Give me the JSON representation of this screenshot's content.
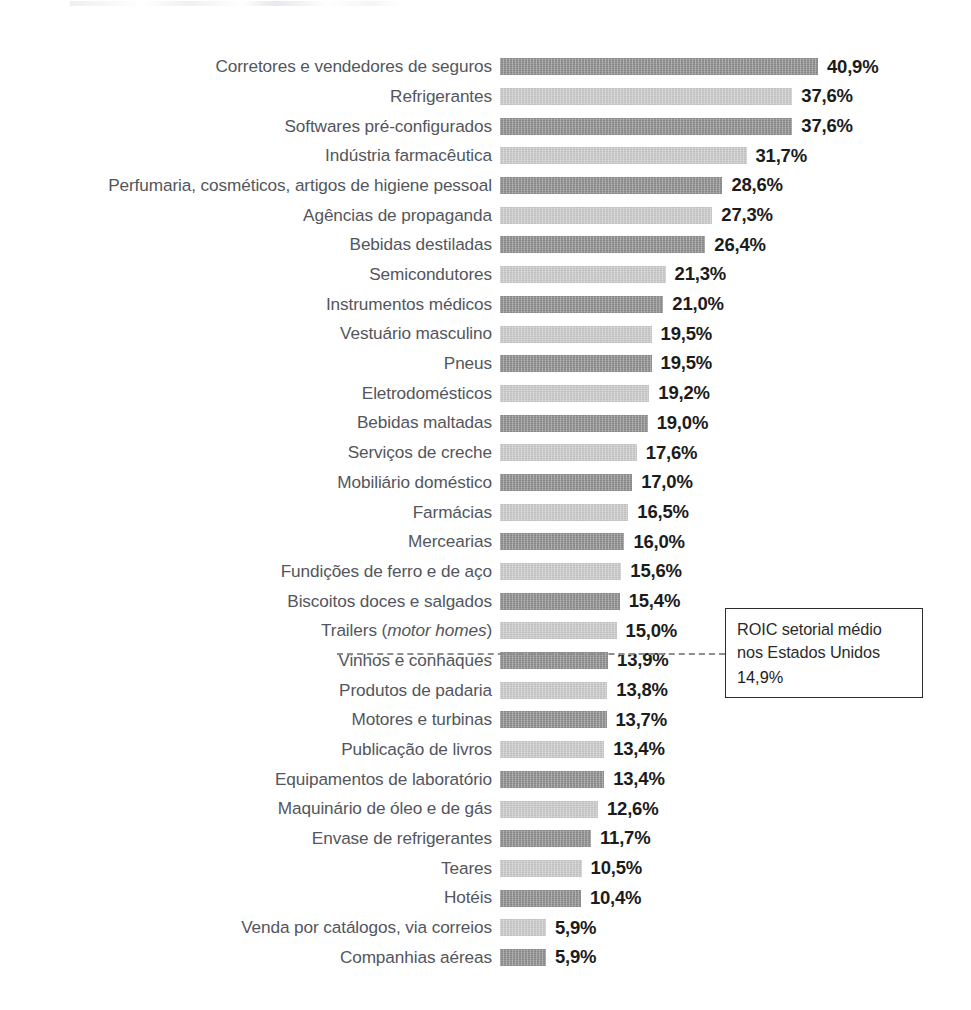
{
  "chart_data": {
    "type": "bar",
    "orientation": "horizontal",
    "title": "",
    "xlabel": "",
    "ylabel": "",
    "value_suffix": "%",
    "decimal_separator": ",",
    "grid": false,
    "legend": false,
    "xlim": [
      0,
      40.9
    ],
    "categories": [
      "Corretores e vendedores de seguros",
      "Refrigerantes",
      "Softwares pré-configurados",
      "Indústria farmacêutica",
      "Perfumaria, cosméticos, artigos de higiene pessoal",
      "Agências de propaganda",
      "Bebidas destiladas",
      "Semicondutores",
      "Instrumentos médicos",
      "Vestuário masculino",
      "Pneus",
      "Eletrodomésticos",
      "Bebidas maltadas",
      "Serviços de creche",
      "Mobiliário doméstico",
      "Farmácias",
      "Mercearias",
      "Fundições de ferro e de aço",
      "Biscoitos doces e salgados",
      "Trailers (motor homes)",
      "Vinhos e conhaques",
      "Produtos de padaria",
      "Motores e turbinas",
      "Publicação de livros",
      "Equipamentos de laboratório",
      "Maquinário de óleo e de gás",
      "Envase de refrigerantes",
      "Teares",
      "Hotéis",
      "Venda por catálogos, via correios",
      "Companhias aéreas"
    ],
    "values": [
      40.9,
      37.6,
      37.6,
      31.7,
      28.6,
      27.3,
      26.4,
      21.3,
      21.0,
      19.5,
      19.5,
      19.2,
      19.0,
      17.6,
      17.0,
      16.5,
      16.0,
      15.6,
      15.4,
      15.0,
      13.9,
      13.8,
      13.7,
      13.4,
      13.4,
      12.6,
      11.7,
      10.5,
      10.4,
      5.9,
      5.9
    ],
    "value_labels": [
      "40,9%",
      "37,6%",
      "37,6%",
      "31,7%",
      "28,6%",
      "27,3%",
      "26,4%",
      "21,3%",
      "21,0%",
      "19,5%",
      "19,5%",
      "19,2%",
      "19,0%",
      "17,6%",
      "17,0%",
      "16,5%",
      "16,0%",
      "15,6%",
      "15,4%",
      "15,0%",
      "13,9%",
      "13,8%",
      "13,7%",
      "13,4%",
      "13,4%",
      "12,6%",
      "11,7%",
      "10,5%",
      "10,4%",
      "5,9%",
      "5,9%"
    ],
    "reference_line": {
      "value": 14.9,
      "label_lines": [
        "ROIC setorial médio",
        "nos Estados Unidos"
      ],
      "value_label": "14,9%",
      "style": "dashed",
      "after_category_index": 19
    },
    "colors": {
      "bar_dark": "#8e8e8e",
      "bar_light": "#c9c9c9",
      "label_text": "#53565c",
      "value_text": "#1c1c1c",
      "reference_line": "#8e8e8e",
      "callout_border": "#2d2d2d",
      "background": "#ffffff"
    }
  }
}
